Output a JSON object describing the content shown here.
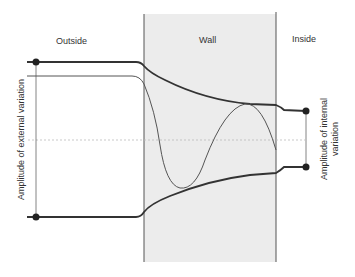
{
  "regions": {
    "outside": "Outside",
    "wall": "Wall",
    "inside": "Inside"
  },
  "labels": {
    "external_amplitude": "Amplitude of external variation",
    "internal_amplitude_line1": "Amplitude of internal",
    "internal_amplitude_line2": "variation"
  },
  "colors": {
    "wall_fill": "#ececec",
    "envelope": "#333333",
    "wave": "#555555",
    "dashed_axis": "#bbbbbb"
  }
}
